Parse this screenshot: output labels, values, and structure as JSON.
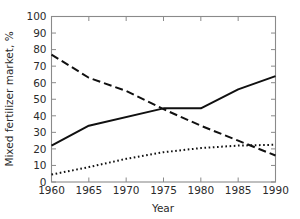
{
  "chart_data": {
    "type": "line",
    "title": "",
    "xlabel": "Year",
    "ylabel": "Mixed fertilizer market, %",
    "xlim": [
      1960,
      1990
    ],
    "ylim": [
      0,
      100
    ],
    "xticks": [
      1960,
      1965,
      1970,
      1975,
      1980,
      1985,
      1990
    ],
    "yticks": [
      0,
      10,
      20,
      30,
      40,
      50,
      60,
      70,
      80,
      90,
      100
    ],
    "grid": false,
    "legend": "none",
    "frame": "box",
    "series": [
      {
        "name": "solid-series",
        "style": "solid",
        "color": "#101010",
        "x": [
          1960,
          1965,
          1975,
          1980,
          1985,
          1990
        ],
        "values": [
          22,
          34,
          44.5,
          44.5,
          56,
          64
        ]
      },
      {
        "name": "dashed-series",
        "style": "dashed",
        "color": "#101010",
        "x": [
          1960,
          1965,
          1970,
          1975,
          1980,
          1985,
          1990
        ],
        "values": [
          77,
          63,
          55,
          44,
          34,
          25,
          16
        ]
      },
      {
        "name": "dotted-series",
        "style": "dotted",
        "color": "#101010",
        "x": [
          1960,
          1965,
          1970,
          1975,
          1980,
          1985,
          1990
        ],
        "values": [
          4.5,
          9,
          14,
          18,
          20.5,
          22,
          22.5
        ]
      }
    ]
  },
  "axes": {
    "x_tick_labels": [
      "1960",
      "1965",
      "1970",
      "1975",
      "1980",
      "1985",
      "1990"
    ],
    "y_tick_labels": [
      "0",
      "10",
      "20",
      "30",
      "40",
      "50",
      "60",
      "70",
      "80",
      "90",
      "100"
    ],
    "x_title": "Year",
    "y_title": "Mixed fertilizer market, %"
  }
}
